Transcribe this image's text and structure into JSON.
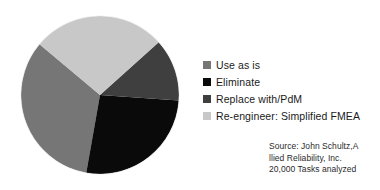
{
  "chart_data": {
    "type": "pie",
    "title": "",
    "subtitle": "",
    "xlabel": "",
    "ylabel": "",
    "legend_position": "right",
    "grid": false,
    "categories": [
      "Use as is",
      "Eliminate",
      "Replace with/PdM",
      "Re-engineer: Simplified FMEA"
    ],
    "values": [
      33,
      27,
      13,
      27
    ],
    "unit": "%",
    "colors": [
      "#767676",
      "#0a0a0a",
      "#3f3f3f",
      "#c8c8c8"
    ],
    "slices": [
      {
        "label": "Use as is",
        "value": 33,
        "color": "#767676",
        "start_angle": 100,
        "end_angle": 220
      },
      {
        "label": "Eliminate",
        "value": 27,
        "color": "#0a0a0a",
        "start_angle": 4,
        "end_angle": 100
      },
      {
        "label": "Replace with/PdM",
        "value": 13,
        "color": "#3f3f3f",
        "start_angle": -42,
        "end_angle": 4
      },
      {
        "label": "Re-engineer: Simplified FMEA",
        "value": 27,
        "color": "#c8c8c8",
        "start_angle": 220,
        "end_angle": 318
      }
    ]
  },
  "legend": {
    "items": [
      {
        "label": "Use as is",
        "color": "#767676",
        "swatch_icon": "legend-swatch-icon"
      },
      {
        "label": "Eliminate",
        "color": "#0a0a0a",
        "swatch_icon": "legend-swatch-icon"
      },
      {
        "label": "Replace with/PdM",
        "color": "#3f3f3f",
        "swatch_icon": "legend-swatch-icon"
      },
      {
        "label": "Re-engineer: Simplified FMEA",
        "color": "#c8c8c8",
        "swatch_icon": "legend-swatch-icon"
      }
    ]
  },
  "source": {
    "line1": "Source: John Schultz,A",
    "line2": "llied Reliability, Inc.",
    "line3": "20,000 Tasks analyzed"
  },
  "colors": {
    "background": "#ffffff",
    "text": "#1a1a1a",
    "source_text": "#2b2b2b",
    "slice_use_as_is": "#767676",
    "slice_eliminate": "#0a0a0a",
    "slice_replace": "#3f3f3f",
    "slice_reengineer": "#c8c8c8"
  }
}
